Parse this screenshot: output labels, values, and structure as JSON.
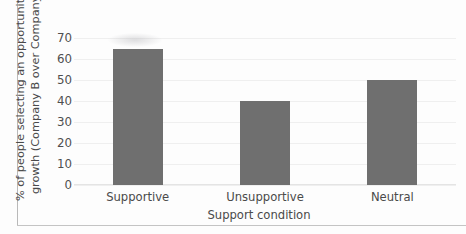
{
  "chart_data": {
    "type": "bar",
    "title": "",
    "subtitle": "",
    "categories": [
      "Supportive",
      "Unsupportive",
      "Neutral"
    ],
    "values": [
      65,
      40,
      50
    ],
    "series": [
      {
        "name": "% of people selecting an opportunity for growth (Company B over Company A)",
        "values": [
          65,
          40,
          50
        ]
      }
    ],
    "xlabel": "Support condition",
    "ylabel_line1": "% of people selecting an opportunity for",
    "ylabel_line2": "growth (Company B over Company A)",
    "ylabel": "% of people selecting an opportunity for growth (Company B over Company A)",
    "ylim": [
      0,
      70
    ],
    "ytick_values": [
      70,
      60,
      50,
      40,
      30,
      20,
      10,
      0
    ],
    "ytick_labels": [
      "70",
      "60",
      "50",
      "40",
      "30",
      "20",
      "10",
      "0"
    ],
    "grid": true,
    "legend": false,
    "legend_position": "none",
    "bar_color": "#6f6f6f",
    "grid_color": "#efefef",
    "text_color": "#4a4a4a",
    "background_color": "#ffffff"
  }
}
